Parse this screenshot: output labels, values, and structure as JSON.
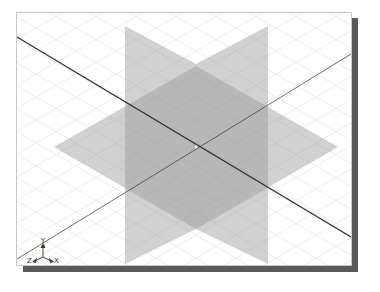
{
  "viewport": {
    "name": "3D modeling viewport",
    "view": "isometric",
    "background": "#ffffff",
    "grid_color": "#e6e6e6",
    "plane_fill": "#9a9a9a",
    "plane_opacity": 0.45,
    "axis_line_color": "#333333"
  },
  "planes": [
    {
      "name": "front-plane",
      "points": "108,13 179,51 179,216 108,251"
    },
    {
      "name": "right-plane",
      "points": "251,13 179,51 179,216 251,251"
    },
    {
      "name": "top-plane",
      "points": "37,134 179,53 321,134 179,216"
    }
  ],
  "axis_lines": [
    {
      "name": "axis-line-descending",
      "x1": 0,
      "y1": 24,
      "x2": 339,
      "y2": 227
    },
    {
      "name": "axis-line-ascending",
      "x1": 0,
      "y1": 246,
      "x2": 339,
      "y2": 38
    }
  ],
  "origin": {
    "x": 179,
    "y": 134
  },
  "triad": {
    "labels": {
      "y": "Y",
      "z": "Z",
      "x": "X"
    }
  }
}
